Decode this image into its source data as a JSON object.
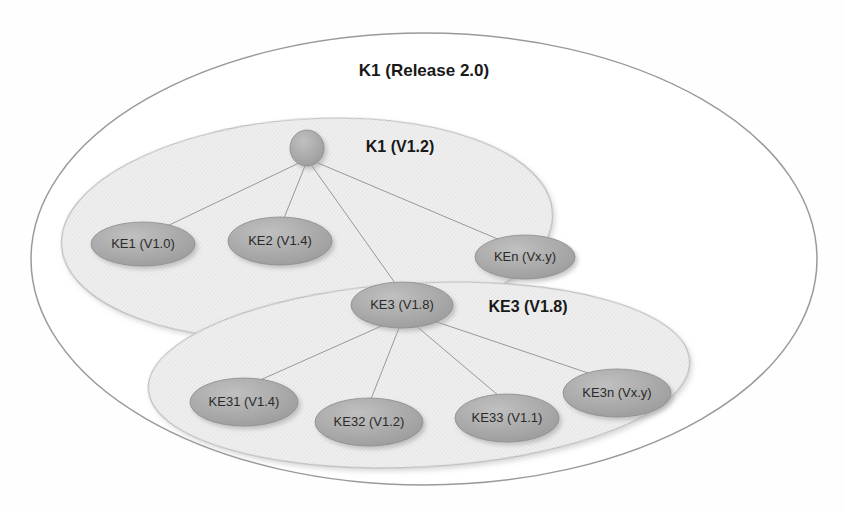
{
  "diagram": {
    "title": "K1 (Release 2.0)",
    "type": "nested-ellipse-tree",
    "background_color": "#ffffff",
    "containers": [
      {
        "id": "outer",
        "label": "K1 (Release 2.0)",
        "fill_color": "#ffffff",
        "stroke_color": "#9a9a9a",
        "label_x": 424,
        "label_y": 72,
        "label_font_size": 17,
        "cx": 424,
        "cy": 259,
        "rx": 393,
        "ry": 226,
        "rotation": 0
      },
      {
        "id": "k1-v12",
        "label": "K1 (V1.2)",
        "fill_color": "#eeeeee",
        "stroke_color": "#bcbcbc",
        "label_x": 400,
        "label_y": 148,
        "label_font_size": 16,
        "cx": 307,
        "cy": 229,
        "rx": 246,
        "ry": 110,
        "rotation": -4
      },
      {
        "id": "ke3-v18",
        "label": "KE3 (V1.8)",
        "fill_color": "#eeeeee",
        "stroke_color": "#bcbcbc",
        "label_x": 528,
        "label_y": 308,
        "label_font_size": 16,
        "cx": 419,
        "cy": 375,
        "rx": 271,
        "ry": 92,
        "rotation": -3
      }
    ],
    "nodes": [
      {
        "id": "root",
        "label": "",
        "cx": 307,
        "cy": 148,
        "rx": 17,
        "ry": 18,
        "font_size": 13,
        "has_label": false
      },
      {
        "id": "ke1",
        "label": "KE1 (V1.0)",
        "cx": 143,
        "cy": 244,
        "rx": 52,
        "ry": 22,
        "font_size": 13,
        "has_label": true
      },
      {
        "id": "ke2",
        "label": "KE2 (V1.4)",
        "cx": 280,
        "cy": 241,
        "rx": 52,
        "ry": 24,
        "font_size": 13,
        "has_label": true
      },
      {
        "id": "ken",
        "label": "KEn (Vx.y)",
        "cx": 525,
        "cy": 257,
        "rx": 50,
        "ry": 22,
        "font_size": 13,
        "has_label": true
      },
      {
        "id": "ke3",
        "label": "KE3 (V1.8)",
        "cx": 402,
        "cy": 305,
        "rx": 51,
        "ry": 23,
        "font_size": 13,
        "has_label": true
      },
      {
        "id": "ke31",
        "label": "KE31 (V1.4)",
        "cx": 244,
        "cy": 402,
        "rx": 54,
        "ry": 24,
        "font_size": 13,
        "has_label": true
      },
      {
        "id": "ke32",
        "label": "KE32 (V1.2)",
        "cx": 369,
        "cy": 422,
        "rx": 54,
        "ry": 24,
        "font_size": 13,
        "has_label": true
      },
      {
        "id": "ke33",
        "label": "KE33 (V1.1)",
        "cx": 507,
        "cy": 418,
        "rx": 52,
        "ry": 24,
        "font_size": 13,
        "has_label": true
      },
      {
        "id": "ke3n",
        "label": "KE3n (Vx.y)",
        "cx": 617,
        "cy": 393,
        "rx": 54,
        "ry": 24,
        "font_size": 13,
        "has_label": true
      }
    ],
    "edges": [
      {
        "from": "root",
        "to": "ke1",
        "x1": 299,
        "y1": 163,
        "x2": 163,
        "y2": 228
      },
      {
        "from": "root",
        "to": "ke2",
        "x1": 305,
        "y1": 166,
        "x2": 284,
        "y2": 218
      },
      {
        "from": "root",
        "to": "ken",
        "x1": 318,
        "y1": 163,
        "x2": 500,
        "y2": 240
      },
      {
        "from": "root",
        "to": "ke3",
        "x1": 312,
        "y1": 166,
        "x2": 395,
        "y2": 283
      },
      {
        "from": "ke3",
        "to": "ke31",
        "x1": 386,
        "y1": 324,
        "x2": 258,
        "y2": 381
      },
      {
        "from": "ke3",
        "to": "ke32",
        "x1": 399,
        "y1": 328,
        "x2": 371,
        "y2": 399
      },
      {
        "from": "ke3",
        "to": "ke33",
        "x1": 415,
        "y1": 325,
        "x2": 499,
        "y2": 396
      },
      {
        "from": "ke3",
        "to": "ke3n",
        "x1": 425,
        "y1": 318,
        "x2": 594,
        "y2": 375
      }
    ],
    "colors": {
      "node_fill": "#a9a9a9",
      "node_stroke": "#8d8d8d",
      "edge_stroke": "#8e8e8e",
      "container_inner_fill": "#eeeeee",
      "container_outer_stroke": "#9a9a9a",
      "text_color": "#2a2a2a",
      "label_color": "#191919"
    }
  }
}
